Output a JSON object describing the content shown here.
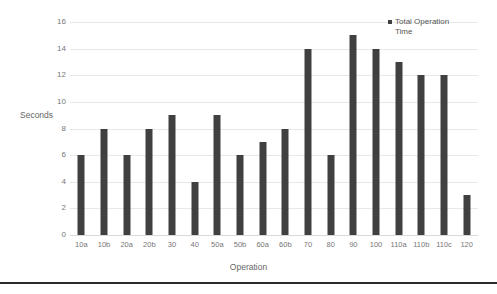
{
  "chart_data": {
    "type": "bar",
    "title": "",
    "xlabel": "Operation",
    "ylabel": "Seconds",
    "ylim": [
      0,
      16
    ],
    "ytick_labels": [
      "16",
      "14",
      "12",
      "10",
      "8",
      "6",
      "4",
      "2",
      "0"
    ],
    "ytick_values": [
      16,
      14,
      12,
      10,
      8,
      6,
      4,
      2,
      0
    ],
    "grid": true,
    "legend_position": "top-right",
    "categories": [
      "10a",
      "10b",
      "20a",
      "20b",
      "30",
      "40",
      "50a",
      "50b",
      "60a",
      "60b",
      "70",
      "80",
      "90",
      "100",
      "110a",
      "110b",
      "110c",
      "120"
    ],
    "values": [
      6,
      8,
      6,
      8,
      9,
      4,
      9,
      6,
      7,
      8,
      14,
      6,
      15,
      14,
      13,
      12,
      12,
      3
    ],
    "series": [
      {
        "name": "Total Operation Time",
        "color": "#404040",
        "values": [
          6,
          8,
          6,
          8,
          9,
          4,
          9,
          6,
          7,
          8,
          14,
          6,
          15,
          14,
          13,
          12,
          12,
          3
        ]
      }
    ],
    "legend": [
      "Total Operation Time"
    ]
  },
  "legend": {
    "marker": "square-marker",
    "label": "Total Operation Time"
  },
  "axes": {
    "y_title": "Seconds",
    "x_title": "Operation"
  },
  "colors": {
    "bar": "#404040",
    "gridline": "#e8e8e8",
    "tick_text": "#777777",
    "axis_title": "#666666",
    "background": "#ffffff",
    "bottom_rule": "#2b2b2b"
  }
}
